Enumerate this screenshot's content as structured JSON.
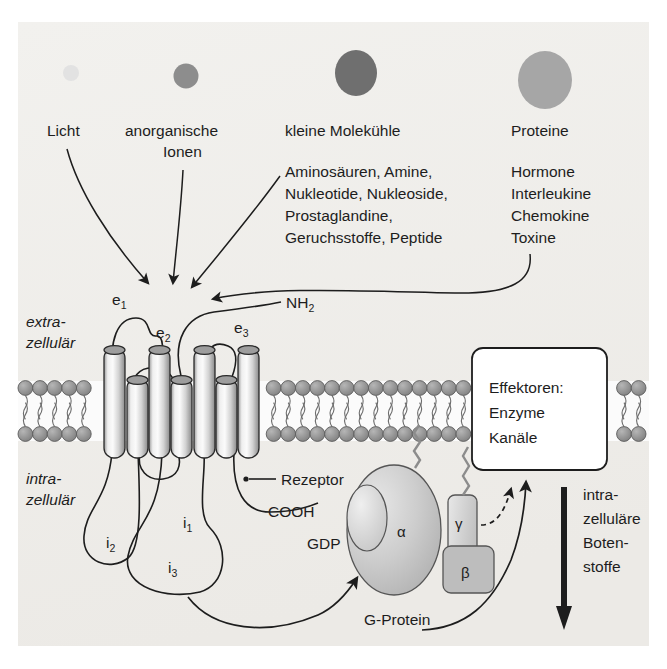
{
  "figure": {
    "title_semantic": "G-protein coupled receptor signalling diagram",
    "background_color": "#f0efec",
    "frame_color": "#ffffff",
    "ink_color": "#1d1d1d"
  },
  "ligands": [
    {
      "label": "Licht",
      "circle_name": "ligand-circle-light",
      "radius": 8,
      "cx": 71,
      "cy": 73,
      "color": "#e2e2e2",
      "label_x": 47,
      "label_y": 135
    },
    {
      "label": "anorganische",
      "label2": "Ionen",
      "circle_name": "ligand-circle-inorganic-ions",
      "radius": 12,
      "cx": 186,
      "cy": 76,
      "color": "#8d8d8d",
      "label_x": 125,
      "label_y": 135
    },
    {
      "label": "kleine Molekühle",
      "circle_name": "ligand-circle-small-molecules",
      "radius": 21,
      "cx": 356,
      "cy": 73,
      "color": "#6f6f6f",
      "label_x": 285,
      "label_y": 135
    },
    {
      "label": "Proteine",
      "circle_name": "ligand-circle-proteins",
      "radius": 27,
      "cx": 545,
      "cy": 80,
      "color": "#a6a6a6",
      "label_x": 511,
      "label_y": 135
    }
  ],
  "small_molecule_list": [
    "Aminosäuren, Amine,",
    "Nukleotide, Nukleoside,",
    "Prostaglandine,",
    "Geruchsstoffe, Peptide"
  ],
  "protein_list": [
    "Hormone",
    "Interleukine",
    "Chemokine",
    "Toxine"
  ],
  "membrane": {
    "extracellular_label_line1": "extra-",
    "extracellular_label_line2": "zellulär",
    "intracellular_label_line1": "intra-",
    "intracellular_label_line2": "zellulär",
    "head_color": "#8f8f8f",
    "tail_color": "#4a4a4a",
    "interior_color": "#fbfbfb"
  },
  "receptor": {
    "name_label": "Rezeptor",
    "n_terminus": "NH",
    "n_terminus_sub": "2",
    "c_terminus": "COOH",
    "extracellular_loops": [
      {
        "base": "e",
        "sub": "1",
        "x": 119,
        "y": 303
      },
      {
        "base": "e",
        "sub": "2",
        "x": 161,
        "y": 330
      },
      {
        "base": "e",
        "sub": "3",
        "x": 238,
        "y": 327
      }
    ],
    "intracellular_loops": [
      {
        "base": "i",
        "sub": "1",
        "x": 179,
        "y": 525
      },
      {
        "base": "i",
        "sub": "2",
        "x": 113,
        "y": 543
      },
      {
        "base": "i",
        "sub": "3",
        "x": 172,
        "y": 566
      }
    ],
    "helix_color_light": "#f3f3f3",
    "helix_color_dark": "#8a8a8a"
  },
  "g_protein": {
    "name_label": "G-Protein",
    "alpha_label": "α",
    "beta_label": "β",
    "gamma_label": "γ",
    "gdp_label": "GDP",
    "body_color": "#c9c9c9",
    "pocket_color": "#d8d8d8"
  },
  "effector_box": {
    "line1": "Effektoren:",
    "line2": "Enzyme",
    "line3": "Kanäle",
    "fill": "#ffffff",
    "border": "#1d1d1d"
  },
  "second_messengers": {
    "line1": "intra-",
    "line2": "zelluläre",
    "line3": "Boten-",
    "line4": "stoffe",
    "arrow_name": "downward-arrow"
  }
}
